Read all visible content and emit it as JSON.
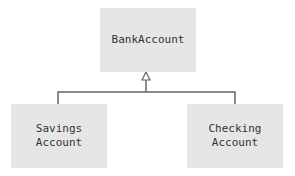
{
  "diagram": {
    "type": "uml-class-inheritance",
    "parent": {
      "label": "BankAccount"
    },
    "children": [
      {
        "label": "Savings\nAccount"
      },
      {
        "label": "Checking\nAccount"
      }
    ],
    "relationship": "generalization",
    "colors": {
      "box_fill": "#e6e6e6",
      "line": "#666666",
      "text": "#333333"
    }
  }
}
